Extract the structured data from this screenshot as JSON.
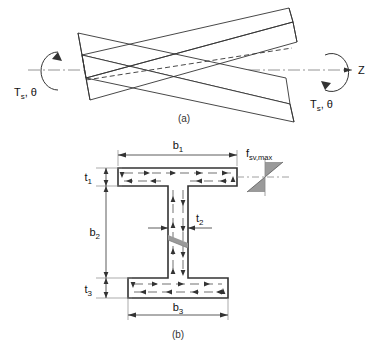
{
  "figure": {
    "title_a_caption": "(a)",
    "title_b_caption": "(b)",
    "panel_a": {
      "name": "twisted-i-beam-under-torsion",
      "axis_label": "Z",
      "torque_left_label": "T",
      "torque_left_sub": "s",
      "torque_left_theta": ", θ",
      "torque_right_label": "T",
      "torque_right_sub": "s",
      "torque_right_theta": ", θ",
      "left_moment_arrow": "counterclockwise-torque-arrow",
      "right_moment_arrow": "counterclockwise-torque-arrow",
      "centerline_style": "dash-dot"
    },
    "panel_b": {
      "name": "i-beam-cross-section-shear-flow",
      "dimensions": [
        {
          "id": "b1",
          "label": "b",
          "sub": "1",
          "meaning": "top-flange-width"
        },
        {
          "id": "b2",
          "label": "b",
          "sub": "2",
          "meaning": "web-depth"
        },
        {
          "id": "b3",
          "label": "b",
          "sub": "3",
          "meaning": "bottom-flange-width"
        },
        {
          "id": "t1",
          "label": "t",
          "sub": "1",
          "meaning": "top-flange-thickness"
        },
        {
          "id": "t2",
          "label": "t",
          "sub": "2",
          "meaning": "web-thickness"
        },
        {
          "id": "t3",
          "label": "t",
          "sub": "3",
          "meaning": "bottom-flange-thickness"
        }
      ],
      "stress_label": "f",
      "stress_sub": "sv,max",
      "stress_meaning": "maximum-st-venant-shear-stress",
      "shear_flow_description": "closed-loop shear flow arrows in flanges and web"
    }
  },
  "colors": {
    "line": "#333333",
    "fill": "#ffffff",
    "stress_fill": "#9a9a9a",
    "centerline": "#777777",
    "text": "#111111"
  }
}
